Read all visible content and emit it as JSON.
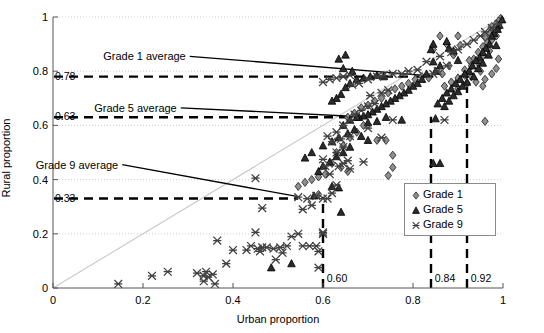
{
  "chart_data": {
    "type": "scatter",
    "title": "",
    "xlabel": "Urban proportion",
    "ylabel": "Rural proportion",
    "xlim": [
      0,
      1
    ],
    "ylim": [
      0,
      1
    ],
    "xticks": [
      0,
      0.2,
      0.4,
      0.6,
      0.8,
      1
    ],
    "yticks": [
      0,
      0.2,
      0.4,
      0.6,
      0.8,
      1
    ],
    "xtick_labels": [
      "0",
      "0.2",
      "0.4",
      "0.6",
      "0.8",
      "1"
    ],
    "ytick_labels": [
      "0",
      "0.2",
      "0.4",
      "0.6",
      "0.8",
      "1"
    ],
    "grid": true,
    "legend_position": "center-right",
    "reference_line": {
      "name": "identity-diagonal",
      "from": [
        0,
        0
      ],
      "to": [
        1,
        1
      ],
      "color": "#c9c9c9"
    },
    "annotations": [
      {
        "text": "Grade 1 average",
        "label_x": 0.295,
        "label_y": 0.855,
        "leader_to_x": 0.845,
        "leader_to_y": 0.782
      },
      {
        "text": "Grade 5 average",
        "label_x": 0.275,
        "label_y": 0.665,
        "leader_to_x": 0.685,
        "leader_to_y": 0.632
      },
      {
        "text": "Grade 9 average",
        "label_x": 0.145,
        "label_y": 0.455,
        "leader_to_x": 0.545,
        "leader_to_y": 0.337
      }
    ],
    "hlines": [
      {
        "value": 0.78,
        "label": "0.78",
        "series": "Grade 1",
        "x_end": 0.845
      },
      {
        "value": 0.63,
        "label": "0.63",
        "series": "Grade 5",
        "x_end": 0.685
      },
      {
        "value": 0.33,
        "label": "0.33",
        "series": "Grade 9",
        "x_end": 0.545
      }
    ],
    "vlines": [
      {
        "value": 0.6,
        "label": "0.60",
        "series": "Grade 9",
        "y_end": 0.337
      },
      {
        "value": 0.84,
        "label": "0.84",
        "series": "Grade 5",
        "y_end": 0.632
      },
      {
        "value": 0.92,
        "label": "0.92",
        "series": "Grade 1",
        "y_end": 0.782
      }
    ],
    "series": [
      {
        "name": "Grade 1",
        "marker": "diamond",
        "color": "#8f8f8f",
        "edge_color": "#303030",
        "points": [
          [
            0.995,
            0.995
          ],
          [
            0.99,
            0.985
          ],
          [
            0.985,
            0.975
          ],
          [
            0.99,
            0.96
          ],
          [
            0.98,
            0.955
          ],
          [
            0.975,
            0.965
          ],
          [
            0.97,
            0.94
          ],
          [
            0.985,
            0.93
          ],
          [
            0.975,
            0.915
          ],
          [
            0.965,
            0.905
          ],
          [
            0.96,
            0.925
          ],
          [
            0.955,
            0.89
          ],
          [
            0.97,
            0.875
          ],
          [
            0.945,
            0.87
          ],
          [
            0.955,
            0.855
          ],
          [
            0.935,
            0.845
          ],
          [
            0.945,
            0.83
          ],
          [
            0.925,
            0.84
          ],
          [
            0.93,
            0.82
          ],
          [
            0.915,
            0.805
          ],
          [
            0.9,
            0.93
          ],
          [
            0.905,
            0.895
          ],
          [
            0.89,
            0.86
          ],
          [
            0.875,
            0.9
          ],
          [
            0.88,
            0.82
          ],
          [
            0.865,
            0.79
          ],
          [
            0.915,
            0.785
          ],
          [
            0.93,
            0.78
          ],
          [
            0.95,
            0.8
          ],
          [
            0.9,
            0.775
          ],
          [
            0.885,
            0.76
          ],
          [
            0.87,
            0.745
          ],
          [
            0.9,
            0.735
          ],
          [
            0.92,
            0.755
          ],
          [
            0.94,
            0.76
          ],
          [
            0.96,
            0.77
          ],
          [
            0.955,
            0.745
          ],
          [
            0.975,
            0.79
          ],
          [
            0.985,
            0.81
          ],
          [
            0.99,
            0.845
          ],
          [
            0.845,
            0.88
          ],
          [
            0.86,
            0.93
          ],
          [
            0.835,
            0.775
          ],
          [
            0.82,
            0.78
          ],
          [
            0.805,
            0.77
          ],
          [
            0.79,
            0.755
          ],
          [
            0.775,
            0.745
          ],
          [
            0.76,
            0.735
          ],
          [
            0.745,
            0.72
          ],
          [
            0.73,
            0.7
          ],
          [
            0.715,
            0.69
          ],
          [
            0.7,
            0.675
          ],
          [
            0.685,
            0.665
          ],
          [
            0.67,
            0.645
          ],
          [
            0.655,
            0.63
          ],
          [
            0.72,
            0.545
          ],
          [
            0.74,
            0.545
          ],
          [
            0.755,
            0.49
          ],
          [
            0.755,
            0.445
          ],
          [
            0.745,
            0.415
          ],
          [
            0.69,
            0.6
          ],
          [
            0.675,
            0.575
          ],
          [
            0.66,
            0.555
          ],
          [
            0.645,
            0.525
          ],
          [
            0.63,
            0.5
          ],
          [
            0.62,
            0.46
          ],
          [
            0.64,
            0.445
          ],
          [
            0.655,
            0.43
          ],
          [
            0.605,
            0.42
          ],
          [
            0.59,
            0.41
          ],
          [
            0.575,
            0.4
          ],
          [
            0.56,
            0.39
          ],
          [
            0.545,
            0.375
          ],
          [
            0.96,
            0.615
          ],
          [
            0.59,
            0.345
          ]
        ]
      },
      {
        "name": "Grade 5",
        "marker": "triangle",
        "color": "#2b2b2b",
        "edge_color": "#000000",
        "points": [
          [
            0.998,
            0.99
          ],
          [
            0.992,
            0.97
          ],
          [
            0.988,
            0.955
          ],
          [
            0.98,
            0.94
          ],
          [
            0.975,
            0.93
          ],
          [
            0.97,
            0.9
          ],
          [
            0.985,
            0.895
          ],
          [
            0.962,
            0.885
          ],
          [
            0.955,
            0.87
          ],
          [
            0.968,
            0.86
          ],
          [
            0.948,
            0.85
          ],
          [
            0.94,
            0.84
          ],
          [
            0.955,
            0.83
          ],
          [
            0.932,
            0.82
          ],
          [
            0.945,
            0.81
          ],
          [
            0.925,
            0.8
          ],
          [
            0.915,
            0.79
          ],
          [
            0.935,
            0.78
          ],
          [
            0.905,
            0.77
          ],
          [
            0.92,
            0.76
          ],
          [
            0.895,
            0.755
          ],
          [
            0.91,
            0.745
          ],
          [
            0.885,
            0.735
          ],
          [
            0.9,
            0.725
          ],
          [
            0.875,
            0.72
          ],
          [
            0.89,
            0.71
          ],
          [
            0.865,
            0.7
          ],
          [
            0.88,
            0.69
          ],
          [
            0.855,
            0.68
          ],
          [
            0.87,
            0.67
          ],
          [
            0.9,
            0.84
          ],
          [
            0.89,
            0.875
          ],
          [
            0.875,
            0.91
          ],
          [
            0.86,
            0.82
          ],
          [
            0.85,
            0.8
          ],
          [
            0.84,
            0.88
          ],
          [
            0.845,
            0.835
          ],
          [
            0.83,
            0.79
          ],
          [
            0.82,
            0.77
          ],
          [
            0.81,
            0.755
          ],
          [
            0.8,
            0.745
          ],
          [
            0.79,
            0.73
          ],
          [
            0.78,
            0.72
          ],
          [
            0.77,
            0.71
          ],
          [
            0.76,
            0.7
          ],
          [
            0.75,
            0.69
          ],
          [
            0.74,
            0.68
          ],
          [
            0.73,
            0.67
          ],
          [
            0.72,
            0.66
          ],
          [
            0.71,
            0.65
          ],
          [
            0.7,
            0.64
          ],
          [
            0.69,
            0.635
          ],
          [
            0.68,
            0.63
          ],
          [
            0.72,
            0.785
          ],
          [
            0.735,
            0.78
          ],
          [
            0.705,
            0.78
          ],
          [
            0.69,
            0.775
          ],
          [
            0.675,
            0.77
          ],
          [
            0.66,
            0.755
          ],
          [
            0.65,
            0.74
          ],
          [
            0.645,
            0.81
          ],
          [
            0.635,
            0.845
          ],
          [
            0.65,
            0.86
          ],
          [
            0.665,
            0.8
          ],
          [
            0.64,
            0.715
          ],
          [
            0.63,
            0.7
          ],
          [
            0.62,
            0.69
          ],
          [
            0.66,
            0.62
          ],
          [
            0.645,
            0.6
          ],
          [
            0.67,
            0.585
          ],
          [
            0.655,
            0.57
          ],
          [
            0.635,
            0.555
          ],
          [
            0.62,
            0.54
          ],
          [
            0.685,
            0.56
          ],
          [
            0.7,
            0.545
          ],
          [
            0.66,
            0.52
          ],
          [
            0.645,
            0.5
          ],
          [
            0.63,
            0.485
          ],
          [
            0.615,
            0.465
          ],
          [
            0.6,
            0.45
          ],
          [
            0.845,
            0.9
          ],
          [
            0.88,
            0.885
          ],
          [
            0.85,
            0.625
          ],
          [
            0.845,
            0.46
          ],
          [
            0.86,
            0.46
          ],
          [
            0.775,
            0.62
          ],
          [
            0.74,
            0.63
          ],
          [
            0.72,
            0.615
          ],
          [
            0.7,
            0.61
          ],
          [
            0.675,
            0.63
          ],
          [
            0.59,
            0.43
          ],
          [
            0.6,
            0.525
          ],
          [
            0.575,
            0.5
          ],
          [
            0.56,
            0.48
          ],
          [
            0.62,
            0.375
          ],
          [
            0.635,
            0.37
          ],
          [
            0.53,
            0.09
          ],
          [
            0.485,
            0.075
          ],
          [
            0.64,
            0.28
          ],
          [
            0.58,
            0.34
          ]
        ]
      },
      {
        "name": "Grade 9",
        "marker": "x-cross",
        "color": "#404040",
        "edge_color": "#404040",
        "points": [
          [
            0.145,
            0.015
          ],
          [
            0.22,
            0.045
          ],
          [
            0.255,
            0.06
          ],
          [
            0.32,
            0.055
          ],
          [
            0.335,
            0.045
          ],
          [
            0.335,
            0.025
          ],
          [
            0.345,
            0.04
          ],
          [
            0.355,
            0.05
          ],
          [
            0.36,
            0.015
          ],
          [
            0.34,
            0.06
          ],
          [
            0.385,
            0.09
          ],
          [
            0.4,
            0.14
          ],
          [
            0.365,
            0.175
          ],
          [
            0.43,
            0.14
          ],
          [
            0.44,
            0.155
          ],
          [
            0.455,
            0.145
          ],
          [
            0.465,
            0.15
          ],
          [
            0.475,
            0.15
          ],
          [
            0.46,
            0.135
          ],
          [
            0.45,
            0.205
          ],
          [
            0.45,
            0.405
          ],
          [
            0.465,
            0.295
          ],
          [
            0.49,
            0.145
          ],
          [
            0.505,
            0.15
          ],
          [
            0.52,
            0.155
          ],
          [
            0.51,
            0.13
          ],
          [
            0.495,
            0.105
          ],
          [
            0.53,
            0.19
          ],
          [
            0.545,
            0.2
          ],
          [
            0.555,
            0.155
          ],
          [
            0.57,
            0.155
          ],
          [
            0.585,
            0.155
          ],
          [
            0.59,
            0.135
          ],
          [
            0.6,
            0.2
          ],
          [
            0.6,
            0.205
          ],
          [
            0.59,
            0.075
          ],
          [
            0.545,
            0.335
          ],
          [
            0.565,
            0.33
          ],
          [
            0.585,
            0.34
          ],
          [
            0.6,
            0.33
          ],
          [
            0.575,
            0.305
          ],
          [
            0.555,
            0.29
          ],
          [
            0.61,
            0.33
          ],
          [
            0.62,
            0.35
          ],
          [
            0.63,
            0.38
          ],
          [
            0.615,
            0.42
          ],
          [
            0.635,
            0.45
          ],
          [
            0.645,
            0.46
          ],
          [
            0.66,
            0.44
          ],
          [
            0.655,
            0.47
          ],
          [
            0.63,
            0.5
          ],
          [
            0.645,
            0.52
          ],
          [
            0.62,
            0.54
          ],
          [
            0.64,
            0.55
          ],
          [
            0.66,
            0.56
          ],
          [
            0.605,
            0.45
          ],
          [
            0.6,
            0.475
          ],
          [
            0.61,
            0.56
          ],
          [
            0.63,
            0.575
          ],
          [
            0.645,
            0.6
          ],
          [
            0.66,
            0.62
          ],
          [
            0.67,
            0.64
          ],
          [
            0.685,
            0.655
          ],
          [
            0.7,
            0.67
          ],
          [
            0.715,
            0.68
          ],
          [
            0.705,
            0.71
          ],
          [
            0.73,
            0.72
          ],
          [
            0.745,
            0.73
          ],
          [
            0.665,
            0.75
          ],
          [
            0.68,
            0.755
          ],
          [
            0.7,
            0.77
          ],
          [
            0.72,
            0.78
          ],
          [
            0.735,
            0.785
          ],
          [
            0.755,
            0.79
          ],
          [
            0.775,
            0.79
          ],
          [
            0.66,
            0.785
          ],
          [
            0.645,
            0.78
          ],
          [
            0.63,
            0.775
          ],
          [
            0.615,
            0.77
          ],
          [
            0.6,
            0.76
          ],
          [
            0.79,
            0.8
          ],
          [
            0.81,
            0.805
          ],
          [
            0.845,
            0.79
          ],
          [
            0.855,
            0.8
          ],
          [
            0.875,
            0.82
          ],
          [
            0.83,
            0.835
          ],
          [
            0.86,
            0.855
          ],
          [
            0.885,
            0.87
          ],
          [
            0.9,
            0.88
          ],
          [
            0.92,
            0.9
          ],
          [
            0.935,
            0.915
          ],
          [
            0.95,
            0.93
          ],
          [
            0.96,
            0.945
          ],
          [
            0.975,
            0.96
          ],
          [
            0.99,
            0.975
          ],
          [
            0.87,
            0.62
          ],
          [
            0.69,
            0.465
          ],
          [
            0.7,
            0.59
          ],
          [
            0.73,
            0.555
          ],
          [
            0.755,
            0.62
          ]
        ]
      }
    ]
  },
  "legend": {
    "items": [
      {
        "label": "Grade 1",
        "marker": "diamond"
      },
      {
        "label": "Grade 5",
        "marker": "triangle"
      },
      {
        "label": "Grade 9",
        "marker": "x-cross"
      }
    ]
  }
}
